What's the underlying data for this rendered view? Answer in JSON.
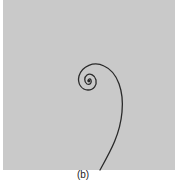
{
  "figure": {
    "caption": "(b)",
    "background_color": "#c9c9c9",
    "curve_color": "#2a2a2a"
  }
}
